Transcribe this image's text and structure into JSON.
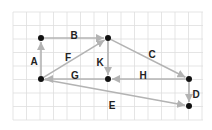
{
  "diagram": {
    "grid": {
      "x0": 13,
      "y0": 12,
      "x1": 203,
      "y1": 120,
      "step": 13.5,
      "color": "#dedede"
    },
    "edge_color": "#b3b3b3",
    "node_color": "#111111",
    "nodes": [
      {
        "id": "n1",
        "x": 41,
        "y": 38
      },
      {
        "id": "n2",
        "x": 108,
        "y": 38
      },
      {
        "id": "n3",
        "x": 41,
        "y": 79
      },
      {
        "id": "n4",
        "x": 108,
        "y": 79
      },
      {
        "id": "n5",
        "x": 189,
        "y": 79
      },
      {
        "id": "n6",
        "x": 189,
        "y": 106
      }
    ],
    "edges": [
      {
        "label": "A",
        "from": "n3",
        "to": "n1",
        "lx": 34,
        "ly": 62
      },
      {
        "label": "B",
        "from": "n1",
        "to": "n2",
        "lx": 74,
        "ly": 36
      },
      {
        "label": "C",
        "from": "n2",
        "to": "n5",
        "lx": 152,
        "ly": 55
      },
      {
        "label": "D",
        "from": "n5",
        "to": "n6",
        "lx": 196,
        "ly": 95
      },
      {
        "label": "E",
        "from": "n3",
        "to": "n6",
        "lx": 112,
        "ly": 106
      },
      {
        "label": "F",
        "from": "n3",
        "to": "n2",
        "lx": 68,
        "ly": 58
      },
      {
        "label": "G",
        "from": "n4",
        "to": "n3",
        "lx": 75,
        "ly": 76
      },
      {
        "label": "H",
        "from": "n5",
        "to": "n4",
        "lx": 143,
        "ly": 76
      },
      {
        "label": "K",
        "from": "n2",
        "to": "n4",
        "lx": 100,
        "ly": 63
      }
    ]
  }
}
